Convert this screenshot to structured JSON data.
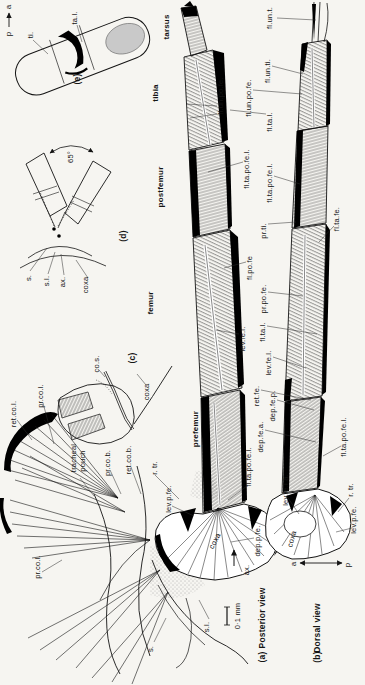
{
  "figure_type": "anatomical line drawing of an arthropod leg musculature, two leg views plus detail insets",
  "page": {
    "background": "#f6f5f1",
    "ink": "#141414",
    "membrane_gray": "#c9c9c9"
  },
  "panels": {
    "a": {
      "tag": "(a)",
      "view": "Posterior view",
      "segments": [
        "tarsus",
        "tibia",
        "postfemur",
        "femur",
        "prefemur",
        "coxa"
      ]
    },
    "b": {
      "tag": "(b)",
      "view": "Dorsal view"
    },
    "c": {
      "tag": "(c)"
    },
    "d": {
      "tag": "(d)",
      "angle": "65°"
    },
    "e": {
      "tag": "(e)"
    }
  },
  "scale_bar": {
    "text": "0·1 mm"
  },
  "axes": {
    "panel_e": {
      "from": "p",
      "to": "a"
    },
    "panel_b": {
      "left": "a",
      "right": "p"
    }
  },
  "labels": {
    "a_letter": "a",
    "p_letter": "p",
    "ti": "ti.",
    "ta_l": "ta.l.",
    "tarsus": "tarsus",
    "tibia": "tibia",
    "postfemur": "postfemur",
    "femur": "femur",
    "prefemur": "prefemur",
    "coxa": "coxa",
    "deg65": "65°",
    "s": "s.",
    "s_l": "s.l.",
    "ax": "ax.",
    "co_s": "co.s.",
    "ret_co_l": "ret.co.l.",
    "pr_co_l": "pr.co.l.",
    "tracheal": "tracheal",
    "pouch": "pouch",
    "pr_co_b": "pr.co.b.",
    "ret_co_b": "ret.co.b.",
    "r_tr": "r. tr.",
    "lev_p_fe": "lev.p.fe.",
    "dep_p_fe": "dep.p.fe.",
    "fl_un_t": "fl.un.t.",
    "fl_un_ti": "fl.un.ti.",
    "fl_un_po_fe": "fl.un.po.fe.",
    "fl_ta_l": "fl.ta.l.",
    "fl_ta_po_fe_l": "fl.ta.po.fe.l.",
    "fl_ta_fe": "fl.ta.fe.",
    "pr_ti": "pr.ti.",
    "fl_po_fe": "fl.po.fe",
    "pr_po_fe": "pr.po.fe.",
    "lev_fe_l": "lev.fe.l.",
    "lev_fe_l_a": "lev.fe.l.a.",
    "ret_fe": "ret.fe.",
    "dep_fe_p": "dep.fe.p.",
    "dep_fe_a": "dep.fe.a."
  }
}
